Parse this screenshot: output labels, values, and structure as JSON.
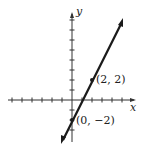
{
  "graph": {
    "axes": {
      "x_label": "x",
      "y_label": "y"
    },
    "line": {
      "equation": "y = 2x - 2",
      "slope": 2,
      "y_intercept": -2,
      "color": "#1a1a1a"
    },
    "points": [
      {
        "label": "(2, 2)",
        "x": 2,
        "y": 2
      },
      {
        "label": "(0, −2)",
        "x": 0,
        "y": -2
      }
    ],
    "x_ticks": [
      -6,
      -5,
      -4,
      -3,
      -2,
      -1,
      1,
      2,
      3,
      4,
      5
    ],
    "y_ticks": [
      -3,
      -2,
      -1,
      1,
      2,
      3,
      4,
      5,
      6,
      7,
      8
    ]
  }
}
